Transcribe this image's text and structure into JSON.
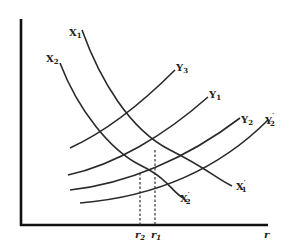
{
  "diagram": {
    "type": "economics curve diagram",
    "x_axis_label": "r",
    "curves": {
      "x1": {
        "label": "X",
        "sub": "1",
        "end_label": "X",
        "end_sub": "1",
        "end_prime": "′"
      },
      "x2": {
        "label": "X",
        "sub": "2",
        "end_label": "X",
        "end_sub": "2",
        "end_prime": "′"
      },
      "y3": {
        "label": "Y",
        "sub": "3",
        "prime": ""
      },
      "y1": {
        "label": "Y",
        "sub": "1",
        "prime": ""
      },
      "y2": {
        "label": "Y",
        "sub": "2",
        "prime": ""
      },
      "y2p": {
        "label": "Y",
        "sub": "2",
        "prime": "′"
      }
    },
    "ticks": {
      "r2": {
        "label": "r",
        "sub": "2"
      },
      "r1": {
        "label": "r",
        "sub": "1"
      }
    }
  }
}
